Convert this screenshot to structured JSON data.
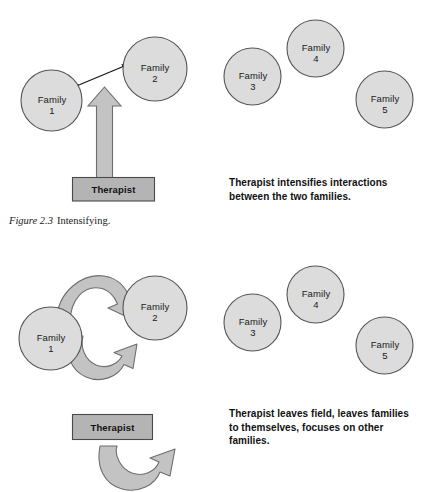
{
  "figure": {
    "caption_number": "Figure 2.3",
    "caption_title": "Intensifying.",
    "colors": {
      "circle_fill": "#dcdcdc",
      "circle_stroke": "#555555",
      "box_fill": "#b4b4b4",
      "box_stroke": "#4a4a4a",
      "arrow_fill": "#c3c3c3",
      "arrow_stroke": "#6e6e6e",
      "thin_arrow": "#111111",
      "text": "#111111",
      "background": "#ffffff"
    }
  },
  "panels": [
    {
      "id": "intensifying-panel",
      "note": "Therapist intensifies interactions between the two families.",
      "therapist_box_label": "Therapist",
      "nodes": [
        {
          "id": "family-1",
          "line1": "Family",
          "line2": "1"
        },
        {
          "id": "family-2",
          "line1": "Family",
          "line2": "2"
        },
        {
          "id": "family-3",
          "line1": "Family",
          "line2": "3"
        },
        {
          "id": "family-4",
          "line1": "Family",
          "line2": "4"
        },
        {
          "id": "family-5",
          "line1": "Family",
          "line2": "5"
        }
      ]
    },
    {
      "id": "leaving-field-panel",
      "note": "Therapist leaves field, leaves families to themselves, focuses on other families.",
      "therapist_box_label": "Therapist",
      "nodes": [
        {
          "id": "family-1",
          "line1": "Family",
          "line2": "1"
        },
        {
          "id": "family-2",
          "line1": "Family",
          "line2": "2"
        },
        {
          "id": "family-3",
          "line1": "Family",
          "line2": "3"
        },
        {
          "id": "family-4",
          "line1": "Family",
          "line2": "4"
        },
        {
          "id": "family-5",
          "line1": "Family",
          "line2": "5"
        }
      ]
    }
  ]
}
